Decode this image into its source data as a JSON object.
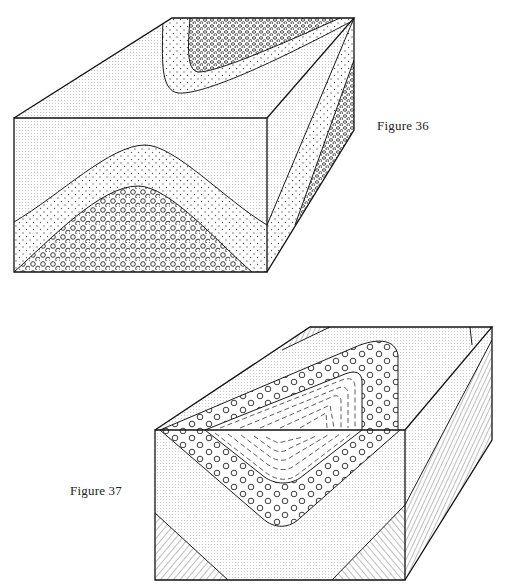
{
  "figures": [
    {
      "id": "figure-36",
      "caption": "Figure 36",
      "description": "Block diagram of an anticline: front face shows an arched fold with fine-dotted layer over coarse-dotted layer over circle-pattern core; top face shows plunging fold nose outcrop pattern",
      "patterns": [
        "fine-stipple",
        "coarse-dots",
        "circles"
      ]
    },
    {
      "id": "figure-37",
      "caption": "Figure 37",
      "description": "Block diagram of a syncline: front face shows a V-shaped trough with circle-pattern band enclosing dashed-pattern core; lower corners show diagonal-hatched beds; right face hatched",
      "patterns": [
        "fine-stipple",
        "circles",
        "dashes",
        "diagonal-hatching"
      ]
    }
  ],
  "colors": {
    "ink": "#1a1a1a",
    "paper": "#ffffff",
    "stipple": "#9a9a9a"
  }
}
